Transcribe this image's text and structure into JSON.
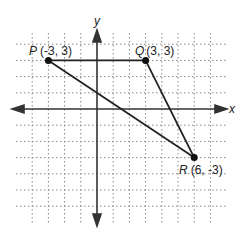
{
  "figure": {
    "type": "coordinate-plane",
    "grid": {
      "x_min": -5,
      "x_max": 7,
      "y_min": -6,
      "y_max": 4,
      "step_px": 16.2,
      "origin_px": [
        97,
        109
      ]
    },
    "axes": {
      "x_label": "x",
      "y_label": "y"
    },
    "points": [
      {
        "name": "P",
        "coords": "(-3, 3)",
        "x": -3,
        "y": 3
      },
      {
        "name": "Q",
        "coords": "(3, 3)",
        "x": 3,
        "y": 3
      },
      {
        "name": "R",
        "coords": "(6, -3)",
        "x": 6,
        "y": -3
      }
    ],
    "segments": [
      [
        "P",
        "Q"
      ],
      [
        "Q",
        "R"
      ],
      [
        "R",
        "P"
      ]
    ],
    "colors": {
      "line": "#222222",
      "grid": "#888888",
      "axis": "#333333"
    }
  }
}
